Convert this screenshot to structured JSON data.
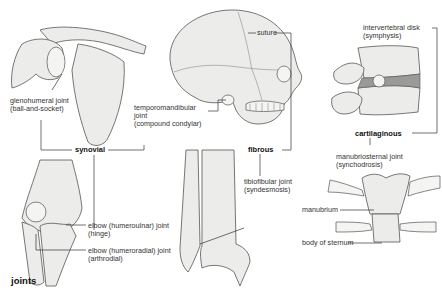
{
  "title": "joints",
  "categories": {
    "synovial": "synovial",
    "fibrous": "fibrous",
    "cartilaginous": "cartilaginous"
  },
  "labels": {
    "glenohumeral": [
      "glenohumeral joint",
      "(ball-and-socket)"
    ],
    "temporomandibular": [
      "temporomandibular",
      "joint",
      "(compound condylar)"
    ],
    "suture": "suture",
    "intervertebral": [
      "intervertebral disk",
      "(symphysis)"
    ],
    "humeroulnar": [
      "elbow (humeroulnar) joint",
      "(hinge)"
    ],
    "humeroradial": [
      "elbow (humeroradial) joint",
      "(arthrodial)"
    ],
    "tibiofibular": [
      "tibiofibular joint",
      "(syndesmosis)"
    ],
    "manubriosternal": [
      "manubriosternal joint",
      "(synchodrosis)"
    ],
    "manubrium": "manubrium",
    "body_of_sternum": "body of sternum"
  },
  "colors": {
    "bone_fill": "#ececea",
    "outline": "#555555",
    "disk": "#9a9a98",
    "text": "#333333"
  }
}
